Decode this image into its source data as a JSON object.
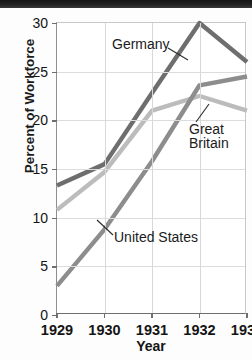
{
  "chart_data": {
    "type": "line",
    "title": "",
    "xlabel": "Year",
    "ylabel": "Percent of Workforce",
    "categories": [
      "1929",
      "1930",
      "1931",
      "1932",
      "1933"
    ],
    "x": [
      1929,
      1930,
      1931,
      1932,
      1933
    ],
    "xlim": [
      1929,
      1933
    ],
    "ylim": [
      0,
      30
    ],
    "yticks": [
      0,
      5,
      10,
      15,
      20,
      25,
      30
    ],
    "ytick_labels": [
      "0",
      "5",
      "10",
      "15",
      "20",
      "25",
      "30"
    ],
    "grid": true,
    "legend": "none (direct series labels with leader lines)",
    "series": [
      {
        "name": "Germany",
        "color": "#6e6e6e",
        "values": [
          13.3,
          15.5,
          22.8,
          30.0,
          26.0
        ]
      },
      {
        "name": "Great Britain",
        "color": "#bcbcbc",
        "values": [
          10.8,
          14.7,
          21.0,
          22.5,
          21.0
        ]
      },
      {
        "name": "United States",
        "color": "#8d8d8d",
        "values": [
          3.0,
          8.8,
          15.8,
          23.6,
          24.5
        ]
      }
    ],
    "annotations": [
      {
        "text": "Germany",
        "series": "Germany"
      },
      {
        "text_line1": "Great",
        "text_line2": "Britain",
        "series": "Great Britain"
      },
      {
        "text": "United States",
        "series": "United States"
      }
    ]
  },
  "axes": {
    "y_title": "Percent of Workforce",
    "x_title": "Year",
    "y_ticks": [
      "30",
      "25",
      "20",
      "15",
      "10",
      "5",
      "0"
    ],
    "x_ticks": [
      "1929",
      "1930",
      "1931",
      "1932",
      "1933"
    ]
  },
  "labels": {
    "germany": "Germany",
    "great_britain_line1": "Great",
    "great_britain_line2": "Britain",
    "united_states": "United States"
  },
  "colors": {
    "germany": "#6e6e6e",
    "great_britain": "#bcbcbc",
    "united_states": "#8d8d8d",
    "grid": "#d8d8d8",
    "text": "#141414"
  }
}
